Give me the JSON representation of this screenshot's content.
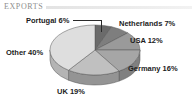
{
  "header": {
    "title": "EXPORTS"
  },
  "chart_data": {
    "type": "pie",
    "title": "EXPORTS",
    "xlabel": "",
    "ylabel": "",
    "units": "percent",
    "legend_position": "none",
    "grid": false,
    "three_d": true,
    "start_angle_deg": 0,
    "direction": "clockwise",
    "categories": [
      "Portugal",
      "Netherlands",
      "USA",
      "Germany",
      "UK",
      "Other"
    ],
    "values": [
      6,
      7,
      12,
      16,
      19,
      40
    ],
    "labels": [
      "Portugal 6%",
      "Netherlands 7%",
      "USA 12%",
      "Germany 16%",
      "UK 19%",
      "Other 40%"
    ],
    "slice_colors": [
      "#6b6b6b",
      "#7e7e7e",
      "#9a9a9a",
      "#a6a6a6",
      "#c0c0c0",
      "#dedede"
    ],
    "side_colors": [
      "#4e4e4e",
      "#5d5d5d",
      "#757575",
      "#808080",
      "#949494",
      "#b4b4b4"
    ],
    "edge_color": "#555555",
    "background": "#ffffff",
    "title_color": "#8e8e8e",
    "label_color": "#1c1c1c"
  },
  "slices": [
    {
      "name": "Portugal",
      "label": "Portugal 6%",
      "value": 6,
      "fill": "#6b6b6b",
      "side": "#4e4e4e"
    },
    {
      "name": "Netherlands",
      "label": "Netherlands 7%",
      "value": 7,
      "fill": "#7e7e7e",
      "side": "#5d5d5d"
    },
    {
      "name": "USA",
      "label": "USA 12%",
      "value": 12,
      "fill": "#9a9a9a",
      "side": "#757575"
    },
    {
      "name": "Germany",
      "label": "Germany 16%",
      "value": 16,
      "fill": "#a6a6a6",
      "side": "#808080"
    },
    {
      "name": "UK",
      "label": "UK 19%",
      "value": 19,
      "fill": "#c0c0c0",
      "side": "#949494"
    },
    {
      "name": "Other",
      "label": "Other 40%",
      "value": 40,
      "fill": "#dedede",
      "side": "#b4b4b4"
    }
  ]
}
